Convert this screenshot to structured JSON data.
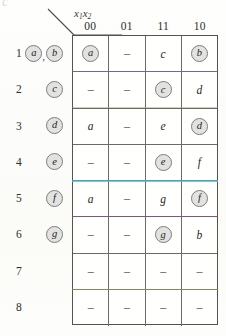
{
  "figure": {
    "kind": "state-transition-table",
    "corner_glyph": "c",
    "axis_label_main": "x",
    "axis_label_sub1": "1",
    "axis_label_main2": "x",
    "axis_label_sub2": "2"
  },
  "columns": [
    {
      "label": "00"
    },
    {
      "label": "01"
    },
    {
      "label": "11"
    },
    {
      "label": "10"
    }
  ],
  "rows": [
    {
      "number": "1",
      "states": [
        {
          "text": "a",
          "circled": true
        },
        {
          "text": "b",
          "circled": true
        }
      ],
      "separator": ",",
      "cells": [
        {
          "text": "a",
          "circled": true
        },
        {
          "text": "–",
          "circled": false
        },
        {
          "text": "c",
          "circled": false
        },
        {
          "text": "b",
          "circled": true
        }
      ]
    },
    {
      "number": "2",
      "states": [
        {
          "text": "c",
          "circled": true
        }
      ],
      "separator": "",
      "cells": [
        {
          "text": "–",
          "circled": false
        },
        {
          "text": "–",
          "circled": false
        },
        {
          "text": "c",
          "circled": true
        },
        {
          "text": "d",
          "circled": false
        }
      ]
    },
    {
      "number": "3",
      "states": [
        {
          "text": "d",
          "circled": true
        }
      ],
      "separator": "",
      "cells": [
        {
          "text": "a",
          "circled": false
        },
        {
          "text": "–",
          "circled": false
        },
        {
          "text": "e",
          "circled": false
        },
        {
          "text": "d",
          "circled": true
        }
      ]
    },
    {
      "number": "4",
      "states": [
        {
          "text": "e",
          "circled": true
        }
      ],
      "separator": "",
      "cells": [
        {
          "text": "–",
          "circled": false
        },
        {
          "text": "–",
          "circled": false
        },
        {
          "text": "e",
          "circled": true
        },
        {
          "text": "f",
          "circled": false
        }
      ]
    },
    {
      "number": "5",
      "states": [
        {
          "text": "f",
          "circled": true
        }
      ],
      "separator": "",
      "cells": [
        {
          "text": "a",
          "circled": false
        },
        {
          "text": "–",
          "circled": false
        },
        {
          "text": "g",
          "circled": false
        },
        {
          "text": "f",
          "circled": true
        }
      ]
    },
    {
      "number": "6",
      "states": [
        {
          "text": "g",
          "circled": true
        }
      ],
      "separator": "",
      "cells": [
        {
          "text": "–",
          "circled": false
        },
        {
          "text": "–",
          "circled": false
        },
        {
          "text": "g",
          "circled": true
        },
        {
          "text": "b",
          "circled": false
        }
      ]
    },
    {
      "number": "7",
      "states": [],
      "separator": "",
      "cells": [
        {
          "text": "–",
          "circled": false
        },
        {
          "text": "–",
          "circled": false
        },
        {
          "text": "–",
          "circled": false
        },
        {
          "text": "–",
          "circled": false
        }
      ]
    },
    {
      "number": "8",
      "states": [],
      "separator": "",
      "cells": [
        {
          "text": "–",
          "circled": false
        },
        {
          "text": "–",
          "circled": false
        },
        {
          "text": "–",
          "circled": false
        },
        {
          "text": "–",
          "circled": false
        }
      ]
    }
  ],
  "artifacts": [
    {
      "name": "blue-line-row1",
      "top": 71,
      "color": "#6a6fb0",
      "height": 1,
      "opacity": 0.55
    },
    {
      "name": "olive-line-row2",
      "top": 107,
      "color": "#8f8f5c",
      "height": 1,
      "opacity": 0.4
    },
    {
      "name": "teal-band-row4",
      "top": 180,
      "color": "#49b7c4",
      "height": 2.4,
      "opacity": 0.75
    },
    {
      "name": "purple-line-row5",
      "top": 216,
      "color": "#a0427f",
      "height": 1.2,
      "opacity": 0.6
    },
    {
      "name": "green-line-row7",
      "top": 289,
      "color": "#7fb04a",
      "height": 1,
      "opacity": 0.55
    }
  ],
  "colors": {
    "grid_border": "#53534f",
    "grid_line": "#6a6a66",
    "text": "#1f1f1e",
    "circle_fill": "#e2e2e1",
    "circle_stroke": "#7d7d7c",
    "page": "#fdfdfb"
  }
}
